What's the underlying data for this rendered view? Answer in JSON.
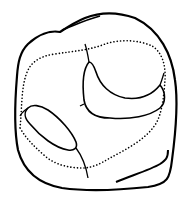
{
  "figure": {
    "type": "line-drawing",
    "stroke_color": "#000000",
    "background_color": "#ffffff"
  },
  "caption": {
    "visible": "partially-clipped",
    "text": ""
  }
}
